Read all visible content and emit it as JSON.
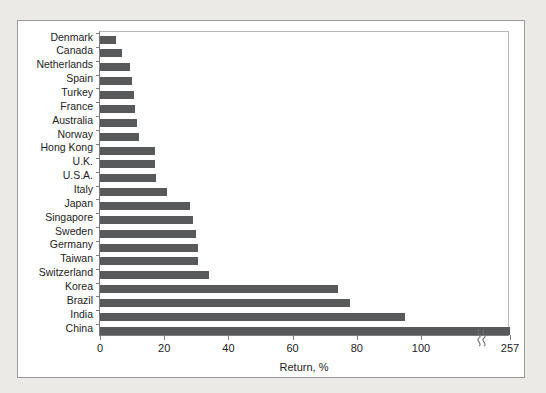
{
  "chart_data": {
    "type": "bar",
    "orientation": "horizontal",
    "title": "",
    "xlabel": "Return, %",
    "ylabel": "",
    "xlim": [
      0,
      257
    ],
    "xticks": [
      0,
      20,
      40,
      60,
      80,
      100,
      257
    ],
    "xticklabels": [
      "0",
      "20",
      "40",
      "60",
      "80",
      "100",
      "257"
    ],
    "axis_break": {
      "present": true,
      "symbol": "double-s-squiggle",
      "between": [
        100,
        257
      ]
    },
    "grid": false,
    "legend": false,
    "bar_color": "#58595b",
    "categories": [
      "Denmark",
      "Canada",
      "Netherlands",
      "Spain",
      "Turkey",
      "France",
      "Australia",
      "Norway",
      "Hong Kong",
      "U.K.",
      "U.S.A.",
      "Italy",
      "Japan",
      "Singapore",
      "Sweden",
      "Germany",
      "Taiwan",
      "Switzerland",
      "Korea",
      "Brazil",
      "India",
      "China"
    ],
    "values": [
      5,
      7,
      9.5,
      10,
      10.5,
      11,
      11.5,
      12,
      17,
      17,
      17.5,
      21,
      28,
      29,
      30,
      30.5,
      30.5,
      34,
      74,
      78,
      95,
      257
    ]
  }
}
